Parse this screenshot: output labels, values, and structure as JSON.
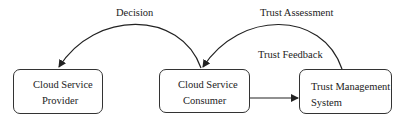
{
  "nodes": {
    "provider": {
      "line1": "Cloud Service",
      "line2": "Provider"
    },
    "consumer": {
      "line1": "Cloud Service",
      "line2": "Consumer"
    },
    "trust_mgmt": {
      "line1": "Trust Management",
      "line2": "System"
    }
  },
  "edges": {
    "decision": {
      "label": "Decision",
      "from": "Cloud Service Consumer",
      "to": "Cloud Service Provider"
    },
    "trust_assessment": {
      "label": "Trust Assessment",
      "from": "Trust Management System",
      "to": "Cloud Service Consumer"
    },
    "trust_feedback": {
      "label": "Trust Feedback",
      "from": "Cloud Service Consumer",
      "to": "Trust Management System"
    }
  },
  "colors": {
    "stroke": "#222222",
    "background": "#ffffff"
  }
}
